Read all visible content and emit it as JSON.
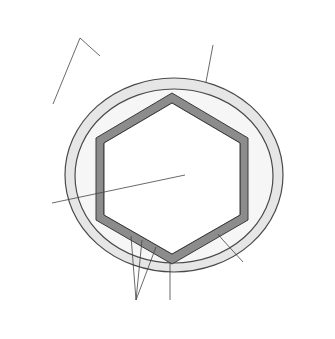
{
  "diagram": {
    "type": "labeled-illustration",
    "colors": {
      "background": "#ffffff",
      "envelope_fill": "#e6e6e6",
      "interior_fill": "#f5f5f5",
      "outline": "#4a4a4a",
      "spike_fill": "#9b9b9b",
      "capsid_fill": "#8c8c8c",
      "helix_stroke": "#555555",
      "leader_line": "#444444",
      "text": "#333333"
    },
    "labels": {
      "spikes": {
        "line1": "Spikes",
        "line2": "(projections)"
      },
      "envelope": {
        "line1": "Envelope",
        "line2": "(membrane)"
      },
      "nucleic_acid": {
        "line1": "Nucleic",
        "line2": "acid"
      },
      "capsid": {
        "line1": "Capsid",
        "line2": "(protein coat)"
      },
      "capsomeres": {
        "line1": "Capsomeres",
        "line2": "(capsid subunits)"
      }
    },
    "components": [
      {
        "id": "spikes",
        "count": 12
      },
      {
        "id": "envelope"
      },
      {
        "id": "capsid",
        "shape": "hexagon"
      },
      {
        "id": "capsomeres",
        "shape": "triangles along capsid"
      },
      {
        "id": "nucleic-acid",
        "shape": "double helix"
      }
    ]
  }
}
